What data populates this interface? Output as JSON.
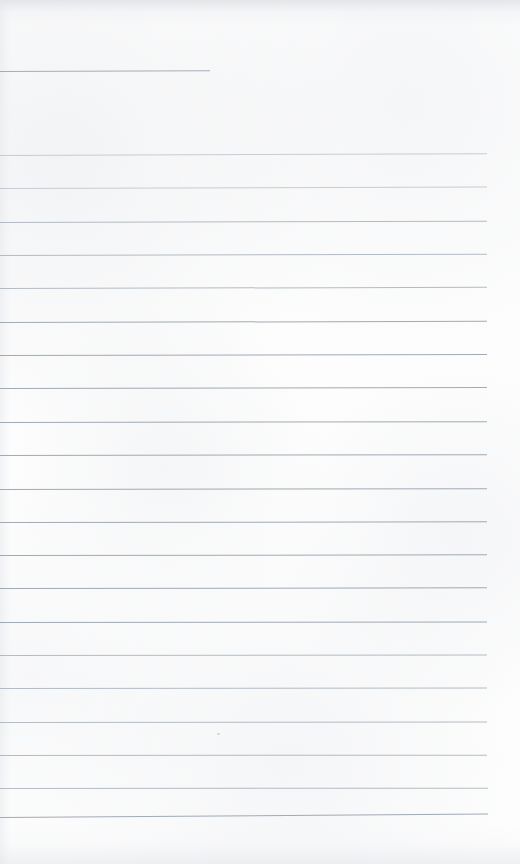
{
  "page": {
    "kind": "blank-ruled-notebook-page",
    "width": 520,
    "height": 864,
    "background_color": "#fdfdfd",
    "rule_color": "#a8b0b8",
    "rule_color_light": "#b4bcc4",
    "rule_color_dark": "#9aa3ad",
    "has_text": false,
    "has_handwriting": false,
    "caption": ""
  },
  "rules": [
    {
      "name": "rule-partial-1",
      "y": 71,
      "x": 0,
      "width": 210,
      "tilt": -0.22,
      "weight": "partial"
    },
    {
      "name": "rule-1",
      "y": 155,
      "x": 0,
      "width": 487,
      "tilt": -0.2,
      "weight": "faint"
    },
    {
      "name": "rule-2",
      "y": 188,
      "x": 0,
      "width": 487,
      "tilt": -0.18,
      "weight": "faint"
    },
    {
      "name": "rule-3",
      "y": 222,
      "x": 0,
      "width": 487,
      "tilt": -0.16,
      "weight": "normal"
    },
    {
      "name": "rule-4",
      "y": 255,
      "x": 0,
      "width": 487,
      "tilt": -0.16,
      "weight": "normal"
    },
    {
      "name": "rule-5",
      "y": 288,
      "x": 0,
      "width": 487,
      "tilt": -0.14,
      "weight": "normal"
    },
    {
      "name": "rule-6",
      "y": 322,
      "x": 0,
      "width": 487,
      "tilt": -0.14,
      "weight": "mid"
    },
    {
      "name": "rule-7",
      "y": 355,
      "x": 0,
      "width": 487,
      "tilt": -0.12,
      "weight": "mid"
    },
    {
      "name": "rule-8",
      "y": 388,
      "x": 0,
      "width": 487,
      "tilt": -0.12,
      "weight": "mid"
    },
    {
      "name": "rule-9",
      "y": 422,
      "x": 0,
      "width": 487,
      "tilt": -0.1,
      "weight": "mid"
    },
    {
      "name": "rule-10",
      "y": 455,
      "x": 0,
      "width": 487,
      "tilt": -0.1,
      "weight": "mid"
    },
    {
      "name": "rule-11",
      "y": 489,
      "x": 0,
      "width": 487,
      "tilt": -0.1,
      "weight": "mid"
    },
    {
      "name": "rule-12",
      "y": 522,
      "x": 0,
      "width": 487,
      "tilt": -0.08,
      "weight": "mid"
    },
    {
      "name": "rule-13",
      "y": 555,
      "x": 0,
      "width": 487,
      "tilt": -0.08,
      "weight": "mid"
    },
    {
      "name": "rule-14",
      "y": 588,
      "x": 0,
      "width": 487,
      "tilt": -0.08,
      "weight": "mid"
    },
    {
      "name": "rule-15",
      "y": 622,
      "x": 0,
      "width": 487,
      "tilt": -0.06,
      "weight": "mid"
    },
    {
      "name": "rule-16",
      "y": 655,
      "x": 0,
      "width": 487,
      "tilt": -0.06,
      "weight": "normal"
    },
    {
      "name": "rule-17",
      "y": 688,
      "x": 0,
      "width": 487,
      "tilt": -0.06,
      "weight": "normal"
    },
    {
      "name": "rule-18",
      "y": 722,
      "x": 0,
      "width": 487,
      "tilt": -0.06,
      "weight": "normal"
    },
    {
      "name": "rule-19",
      "y": 755,
      "x": 0,
      "width": 487,
      "tilt": -0.04,
      "weight": "normal"
    },
    {
      "name": "rule-20",
      "y": 788,
      "x": 0,
      "width": 488,
      "tilt": -0.04,
      "weight": "normal"
    },
    {
      "name": "rule-21",
      "y": 817,
      "x": 0,
      "width": 488,
      "tilt": -0.4,
      "weight": "mid"
    }
  ],
  "marks": [
    {
      "name": "paper-speck",
      "x": 217,
      "y": 733,
      "width": 3,
      "height": 2
    }
  ]
}
